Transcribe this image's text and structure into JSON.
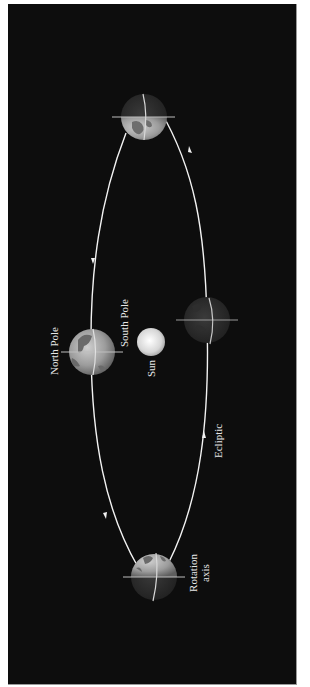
{
  "diagram": {
    "type": "orbital-diagram",
    "colors": {
      "background": "#0d0d0d",
      "frame": "#ffffff",
      "orbit": "#f2f2f2",
      "text": "#e6e6e6",
      "sun": "#dcdcdc"
    },
    "labels": {
      "north_pole": "North Pole",
      "south_pole": "South Pole",
      "sun": "Sun",
      "ecliptic": "Ecliptic",
      "rotation_axis_line1": "Rotation",
      "rotation_axis_line2": "axis"
    },
    "objects": [
      {
        "name": "earth-top",
        "cx": 144,
        "cy": 117,
        "r": 23
      },
      {
        "name": "earth-left",
        "cx": 92,
        "cy": 352,
        "r": 23
      },
      {
        "name": "earth-right",
        "cx": 207,
        "cy": 320,
        "r": 23
      },
      {
        "name": "earth-bottom",
        "cx": 154,
        "cy": 577,
        "r": 23
      },
      {
        "name": "sun",
        "cx": 151,
        "cy": 342,
        "r": 14
      }
    ],
    "orbit_direction_arrows": [
      "left-side-down",
      "right-side-up"
    ]
  }
}
